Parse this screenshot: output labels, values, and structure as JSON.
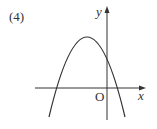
{
  "problem_label": "(4)",
  "axes": {
    "x_label": "x",
    "y_label": "y",
    "origin_label": "O"
  },
  "curve": {
    "type": "downward-opening parabola",
    "vertex_position": "left of y-axis, above x-axis",
    "y_intercept": "positive",
    "roots": "one negative, one positive"
  },
  "colors": {
    "stroke": "#333333",
    "background": "#ffffff"
  }
}
